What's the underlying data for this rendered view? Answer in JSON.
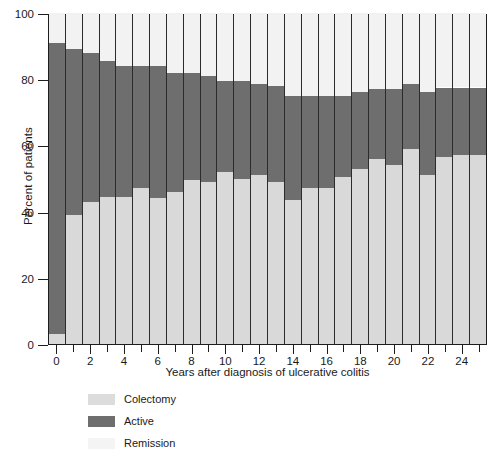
{
  "chart_data": {
    "type": "bar",
    "subtype": "stacked-bar-100",
    "title": "",
    "xlabel": "Years after diagnosis of ulcerative colitis",
    "ylabel": "Percent of patients",
    "ylim": [
      0,
      100
    ],
    "xlim": [
      -0.5,
      25.5
    ],
    "ytick_labels": [
      "0",
      "20",
      "40",
      "60",
      "80",
      "100"
    ],
    "ytick_values": [
      0,
      20,
      40,
      60,
      80,
      100
    ],
    "xtick_labels": [
      "0",
      "2",
      "4",
      "6",
      "8",
      "10",
      "12",
      "14",
      "16",
      "18",
      "20",
      "22",
      "24"
    ],
    "xtick_values": [
      0,
      2,
      4,
      6,
      8,
      10,
      12,
      14,
      16,
      18,
      20,
      22,
      24
    ],
    "xtick_minor_values": [
      1,
      3,
      5,
      7,
      9,
      11,
      13,
      15,
      17,
      19,
      21,
      23,
      25
    ],
    "grid": false,
    "legend_position": "below-left",
    "categories": [
      0,
      1,
      2,
      3,
      4,
      5,
      6,
      7,
      8,
      9,
      10,
      11,
      12,
      13,
      14,
      15,
      16,
      17,
      18,
      19,
      20,
      21,
      22,
      23,
      24,
      25
    ],
    "stack_order_bottom_to_top": [
      "Remission",
      "Active",
      "Colectomy"
    ],
    "series": [
      {
        "name": "Remission",
        "color": "#d9d9d9",
        "values": [
          3,
          39,
          43,
          44.5,
          44.5,
          47,
          44,
          46,
          49.5,
          49,
          52,
          50,
          51,
          49,
          43.5,
          47,
          47,
          50.5,
          53,
          56,
          54,
          59,
          51,
          56.5,
          57,
          57
        ]
      },
      {
        "name": "Active",
        "color": "#6e6e6e",
        "values": [
          88,
          50,
          45,
          41,
          39.5,
          37,
          40,
          36,
          32.5,
          32,
          27.5,
          29.5,
          27.5,
          29,
          31.5,
          28,
          28,
          24.5,
          23,
          21,
          23,
          19.5,
          25,
          21,
          20.5,
          20.5
        ]
      },
      {
        "name": "Colectomy",
        "color": "#f2f2f2",
        "values": [
          9,
          11,
          12,
          14.5,
          16,
          16,
          16,
          18,
          18,
          19,
          20.5,
          20.5,
          21.5,
          22,
          25,
          25,
          25,
          25,
          24,
          23,
          23,
          21.5,
          24,
          22.5,
          22.5,
          22.5
        ]
      }
    ],
    "cumulative_tops": {
      "remission_top": [
        3,
        39,
        43,
        44.5,
        44.5,
        47,
        44,
        46,
        49.5,
        49,
        52,
        50,
        51,
        49,
        43.5,
        47,
        47,
        50.5,
        53,
        56,
        54,
        59,
        51,
        56.5,
        57,
        57
      ],
      "active_top": [
        91,
        89,
        88,
        85.5,
        84,
        84,
        84,
        82,
        82,
        81,
        79.5,
        79.5,
        78.5,
        78,
        75,
        75,
        75,
        75,
        76,
        77,
        77,
        78.5,
        76,
        77.5,
        77.5,
        77.5
      ]
    }
  },
  "legend": {
    "items": [
      {
        "label": "Colectomy",
        "color": "#dcdcdc"
      },
      {
        "label": "Active",
        "color": "#6e6e6e"
      },
      {
        "label": "Remission",
        "color": "#f4f4f4"
      }
    ]
  },
  "colors": {
    "remission": "#dedede",
    "active": "#6e6e6e",
    "colectomy": "#f4f4f4",
    "axis": "#1d1d1d",
    "bar_outline": "#2b2b2b",
    "background": "#ffffff",
    "text": "#1a1a1a"
  }
}
